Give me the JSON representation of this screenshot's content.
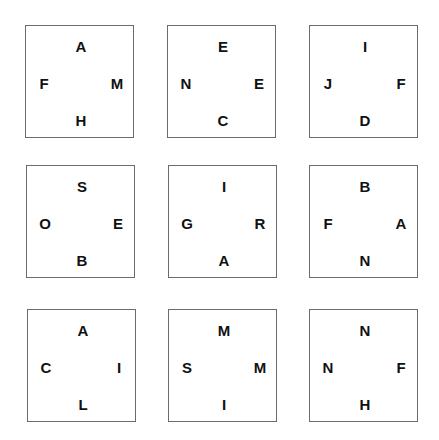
{
  "puzzle": {
    "boxes": [
      {
        "top": "A",
        "left": "F",
        "right": "M",
        "bottom": "H"
      },
      {
        "top": "E",
        "left": "N",
        "right": "E",
        "bottom": "C"
      },
      {
        "top": "I",
        "left": "J",
        "right": "F",
        "bottom": "D"
      },
      {
        "top": "S",
        "left": "O",
        "right": "E",
        "bottom": "B"
      },
      {
        "top": "I",
        "left": "G",
        "right": "R",
        "bottom": "A"
      },
      {
        "top": "B",
        "left": "F",
        "right": "A",
        "bottom": "N"
      },
      {
        "top": "A",
        "left": "C",
        "right": "I",
        "bottom": "L"
      },
      {
        "top": "M",
        "left": "S",
        "right": "M",
        "bottom": "I"
      },
      {
        "top": "N",
        "left": "N",
        "right": "F",
        "bottom": "H"
      }
    ]
  }
}
